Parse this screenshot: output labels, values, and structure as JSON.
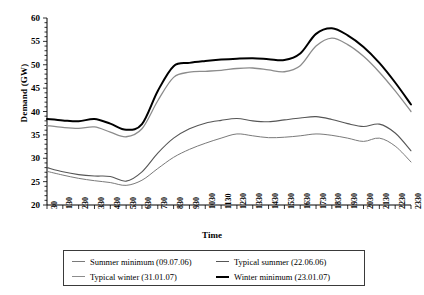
{
  "chart_data": {
    "type": "line",
    "title": "",
    "xlabel": "Time",
    "ylabel": "Demand (GW)",
    "ylim": [
      20,
      60
    ],
    "ytick_step": 5,
    "yticks": [
      20,
      25,
      30,
      35,
      40,
      45,
      50,
      55,
      60
    ],
    "minor_ytick_step": 1,
    "grid": false,
    "legend_position": "bottom",
    "x": [
      "30",
      "130",
      "230",
      "330",
      "430",
      "530",
      "630",
      "730",
      "830",
      "930",
      "1030",
      "1130",
      "1230",
      "1330",
      "1430",
      "1530",
      "1630",
      "1730",
      "1830",
      "1930",
      "2030",
      "2130",
      "2230",
      "2330"
    ],
    "categories": [
      "30",
      "130",
      "230",
      "330",
      "430",
      "530",
      "630",
      "730",
      "830",
      "930",
      "1030",
      "1130",
      "1230",
      "1330",
      "1430",
      "1530",
      "1630",
      "1730",
      "1830",
      "1930",
      "2030",
      "2130",
      "2230",
      "2330"
    ],
    "series": [
      {
        "name": "Summer minimum (09.07.06)",
        "color": "#7a7a7a",
        "width": 1.0,
        "values": [
          27.2,
          26.4,
          25.7,
          25.2,
          24.8,
          24.2,
          25.3,
          27.8,
          30.2,
          31.9,
          33.2,
          34.3,
          35.2,
          34.8,
          34.4,
          34.5,
          34.8,
          35.2,
          34.9,
          34.3,
          33.6,
          34.3,
          32.6,
          29.2
        ]
      },
      {
        "name": "Typical summer (22.06.06)",
        "color": "#565656",
        "width": 1.1,
        "values": [
          28.0,
          27.1,
          26.5,
          26.2,
          26.1,
          25.1,
          27.1,
          31.1,
          34.3,
          36.3,
          37.5,
          38.1,
          38.5,
          38.0,
          37.8,
          38.2,
          38.6,
          38.9,
          38.3,
          37.4,
          36.8,
          37.3,
          35.4,
          31.6
        ]
      },
      {
        "name": "Typical winter (31.01.07)",
        "color": "#8c8c8c",
        "width": 1.3,
        "values": [
          37.0,
          36.6,
          36.4,
          36.7,
          35.6,
          34.6,
          36.3,
          42.3,
          47.3,
          48.4,
          48.6,
          48.8,
          49.2,
          49.3,
          48.9,
          48.5,
          49.8,
          54.0,
          55.7,
          54.3,
          51.8,
          48.4,
          44.4,
          40.0
        ]
      },
      {
        "name": "Winter minimum (23.01.07)",
        "color": "#000000",
        "width": 2.0,
        "values": [
          38.4,
          38.1,
          37.9,
          38.4,
          37.4,
          36.1,
          37.3,
          44.4,
          49.7,
          50.4,
          50.8,
          51.1,
          51.3,
          51.4,
          51.2,
          51.0,
          52.4,
          56.6,
          57.8,
          56.3,
          53.8,
          50.4,
          46.2,
          41.5
        ]
      }
    ]
  },
  "axes": {
    "ylabel": "Demand (GW)",
    "xlabel": "Time",
    "yticks": [
      "60",
      "55",
      "50",
      "45",
      "40",
      "35",
      "30",
      "25",
      "20"
    ],
    "xticks": [
      "30",
      "130",
      "230",
      "330",
      "430",
      "530",
      "630",
      "730",
      "830",
      "930",
      "1030",
      "1130",
      "1230",
      "1330",
      "1430",
      "1530",
      "1630",
      "1730",
      "1830",
      "1930",
      "2030",
      "2130",
      "2230",
      "2330"
    ]
  },
  "legend": {
    "items": [
      {
        "label": "Summer minimum (09.07.06)",
        "color": "#7a7a7a",
        "thickness": "1px"
      },
      {
        "label": "Typical summer (22.06.06)",
        "color": "#565656",
        "thickness": "1px"
      },
      {
        "label": "Typical winter (31.01.07)",
        "color": "#8c8c8c",
        "thickness": "1.5px"
      },
      {
        "label": "Winter minimum (23.01.07)",
        "color": "#000000",
        "thickness": "2px"
      }
    ]
  }
}
